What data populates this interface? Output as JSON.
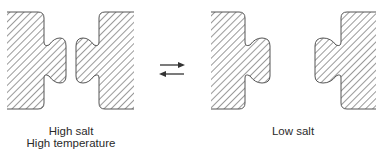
{
  "diagram": {
    "states": [
      {
        "name": "associated",
        "labels": [
          "High salt",
          "High temperature"
        ]
      },
      {
        "name": "dissociated",
        "labels": [
          "Low salt"
        ]
      }
    ],
    "equilibrium_symbol": "forward-reverse-arrows",
    "colors": {
      "outline": "#555555",
      "hatch": "#555555",
      "text": "#2a2a2a",
      "background": "#ffffff"
    }
  }
}
